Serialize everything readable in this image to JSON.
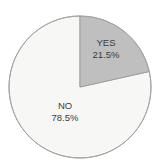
{
  "title_remnant": "· · · · · · · · ·",
  "colors": {
    "background": "#ffffff",
    "slice_yes": "#bfbfbf",
    "slice_no": "#f7f7f5",
    "outline": "#9a9a9a",
    "label_text": "#3b3b3b"
  },
  "chart_data": {
    "type": "pie",
    "title": "",
    "xlabel": "",
    "ylabel": "",
    "legend": "none",
    "labels": [
      "YES",
      "NO"
    ],
    "values": [
      21.5,
      78.5
    ],
    "units": "%",
    "start_angle_deg": 0,
    "direction": "clockwise",
    "slices": [
      {
        "label": "YES",
        "value": 21.5,
        "value_text": "21.5%",
        "color": "#bfbfbf",
        "start_deg": 0,
        "end_deg": 77.4
      },
      {
        "label": "NO",
        "value": 78.5,
        "value_text": "78.5%",
        "color": "#f7f7f5",
        "start_deg": 77.4,
        "end_deg": 360
      }
    ]
  },
  "labels": {
    "yes": {
      "name": "YES",
      "pct": "21.5%"
    },
    "no": {
      "name": "NO",
      "pct": "78.5%"
    }
  }
}
